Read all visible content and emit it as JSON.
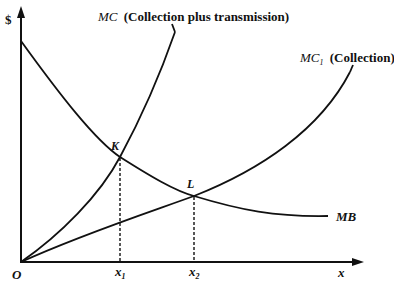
{
  "diagram": {
    "y_axis_label": "$",
    "x_axis_label": "x",
    "origin_label": "O",
    "curves": [
      {
        "id": "mc",
        "name": "MC",
        "description": "(Collection plus transmission)"
      },
      {
        "id": "mc1",
        "name": "MC",
        "subscript": "1",
        "description": "(Collection)"
      },
      {
        "id": "mb",
        "name": "MB"
      }
    ],
    "points": [
      {
        "label": "K",
        "intersection": "MC and MB",
        "x_label": "x",
        "x_sub": "1"
      },
      {
        "label": "L",
        "intersection": "MC1 and MB",
        "x_label": "x",
        "x_sub": "2"
      }
    ]
  }
}
